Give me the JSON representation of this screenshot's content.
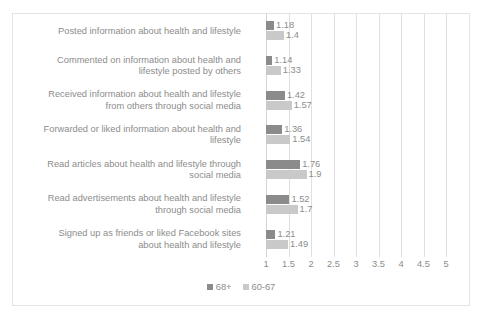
{
  "chart_data": {
    "type": "bar",
    "orientation": "horizontal",
    "title": "",
    "xlabel": "",
    "ylabel": "",
    "xlim": [
      1,
      5
    ],
    "xticks": [
      "1",
      "1.5",
      "2",
      "2.5",
      "3",
      "3.5",
      "4",
      "4.5",
      "5"
    ],
    "grid": true,
    "legend_position": "bottom",
    "categories": [
      "Posted information about health and lifestyle",
      "Commented on information about health and lifestyle posted by others",
      "Received information about health and lifestyle from others through social media",
      "Forwarded or liked information about health and lifestyle",
      "Read articles about health and lifestyle through social media",
      "Read advertisements about health and lifestyle through social media",
      "Signed up as friends or liked Facebook sites about health and lifestyle"
    ],
    "category_lines": [
      [
        "Posted information about health and lifestyle"
      ],
      [
        "Commented on information about health and",
        "lifestyle posted by others"
      ],
      [
        "Received information about health and lifestyle",
        "from others through social media"
      ],
      [
        "Forwarded or liked information about health and",
        "lifestyle"
      ],
      [
        "Read articles about health and lifestyle through",
        "social media"
      ],
      [
        "Read advertisements about health and lifestyle",
        "through social media"
      ],
      [
        "Signed up as friends or liked Facebook sites",
        "about health and lifestyle"
      ]
    ],
    "series": [
      {
        "name": "68+",
        "color": "#8b8b8b",
        "values": [
          1.18,
          1.14,
          1.42,
          1.36,
          1.76,
          1.52,
          1.21
        ],
        "labels": [
          "1.18",
          "1.14",
          "1.42",
          "1.36",
          "1.76",
          "1.52",
          "1.21"
        ]
      },
      {
        "name": "60-67",
        "color": "#c9c9c9",
        "values": [
          1.4,
          1.33,
          1.57,
          1.54,
          1.9,
          1.7,
          1.49
        ],
        "labels": [
          "1.4",
          "1.33",
          "1.57",
          "1.54",
          "1.9",
          "1.7",
          "1.49"
        ]
      }
    ]
  },
  "legend": {
    "items": [
      {
        "label": "68+",
        "color": "#8b8b8b"
      },
      {
        "label": "60-67",
        "color": "#c9c9c9"
      }
    ]
  },
  "colors": {
    "series_dark": "#8b8b8b",
    "series_light": "#c9c9c9",
    "text": "#8c8c8c",
    "gridline": "#e0e0e0",
    "frame": "#e3e3e3",
    "background": "#ffffff"
  }
}
